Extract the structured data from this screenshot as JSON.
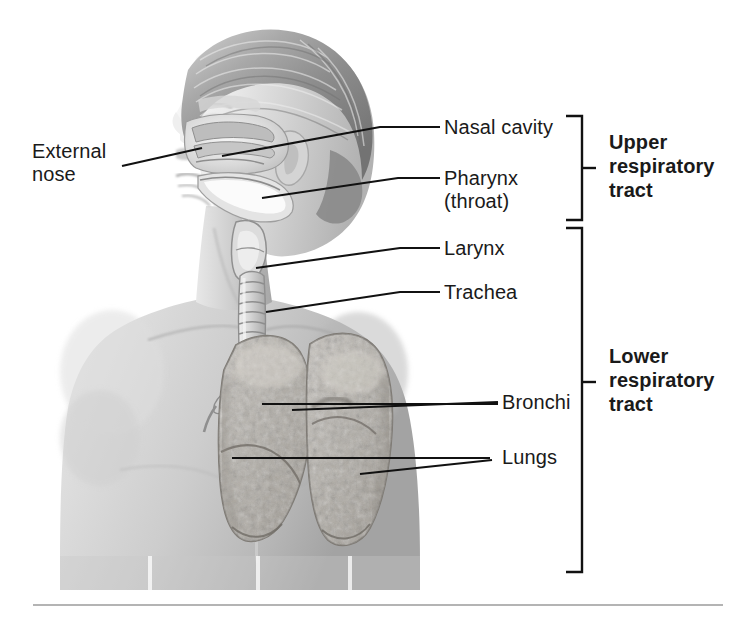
{
  "figure": {
    "background_color": "#ffffff",
    "text_color": "#1a1a1a",
    "rule_color": "#b4b4b4"
  },
  "labels": {
    "external_nose": "External\nnose",
    "nasal_cavity": "Nasal cavity",
    "pharynx": "Pharynx\n(throat)",
    "larynx": "Larynx",
    "trachea": "Trachea",
    "bronchi": "Bronchi",
    "lungs": "Lungs"
  },
  "brackets": {
    "upper": "Upper\nrespiratory\ntract",
    "lower": "Lower\nrespiratory\ntract"
  },
  "illustration": {
    "subject": "human-head-and-torso-lateral-anterior",
    "style": "grayscale-airbrush-medical-illustration",
    "organs": [
      "nasal-cavity",
      "pharynx",
      "larynx",
      "trachea",
      "bronchi",
      "left-lung",
      "right-lung"
    ]
  }
}
